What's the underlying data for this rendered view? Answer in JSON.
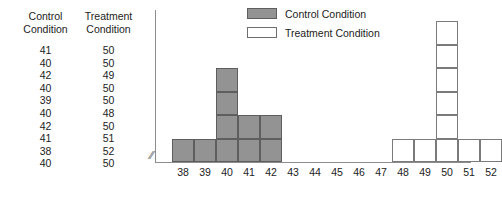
{
  "table": {
    "headers": [
      {
        "line1": "Control",
        "line2": "Condition"
      },
      {
        "line1": "Treatment",
        "line2": "Condition"
      }
    ],
    "rows": [
      {
        "control": "41",
        "treatment": "50"
      },
      {
        "control": "40",
        "treatment": "50"
      },
      {
        "control": "42",
        "treatment": "49"
      },
      {
        "control": "40",
        "treatment": "50"
      },
      {
        "control": "39",
        "treatment": "50"
      },
      {
        "control": "40",
        "treatment": "48"
      },
      {
        "control": "42",
        "treatment": "50"
      },
      {
        "control": "41",
        "treatment": "51"
      },
      {
        "control": "38",
        "treatment": "52"
      },
      {
        "control": "40",
        "treatment": "50"
      }
    ]
  },
  "legend": {
    "items": [
      {
        "label": "Control Condition",
        "color": "#939393"
      },
      {
        "label": "Treatment Condition",
        "color": "#ffffff"
      }
    ]
  },
  "axis": {
    "break_symbol": "//"
  },
  "chart_data": {
    "type": "bar",
    "title": "",
    "xlabel": "",
    "ylabel": "",
    "categories": [
      "38",
      "39",
      "40",
      "41",
      "42",
      "43",
      "44",
      "45",
      "46",
      "47",
      "48",
      "49",
      "50",
      "51",
      "52"
    ],
    "series": [
      {
        "name": "Control Condition",
        "color": "#939393",
        "values": [
          1,
          1,
          4,
          2,
          2,
          0,
          0,
          0,
          0,
          0,
          0,
          0,
          0,
          0,
          0
        ]
      },
      {
        "name": "Treatment Condition",
        "color": "#ffffff",
        "values": [
          0,
          0,
          0,
          0,
          0,
          0,
          0,
          0,
          0,
          0,
          1,
          1,
          6,
          1,
          1
        ]
      }
    ],
    "ylim": [
      0,
      6
    ],
    "grid": false,
    "legend_position": "top-center",
    "axis_break": true,
    "stacked_unit_blocks": true
  }
}
